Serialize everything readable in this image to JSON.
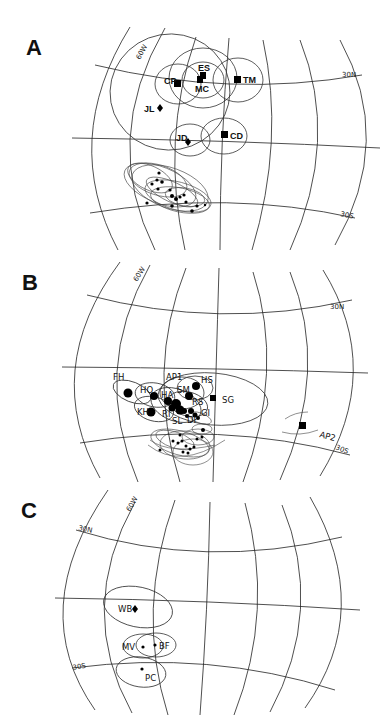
{
  "figure": {
    "panels": [
      {
        "id": "A",
        "label": "A",
        "grid_labels": {
          "meridian": "60W",
          "north_parallel": "30N",
          "south_parallel": "30S"
        },
        "sites": [
          {
            "code": "CP",
            "symbol": "square"
          },
          {
            "code": "ES",
            "symbol": "square"
          },
          {
            "code": "MC",
            "symbol": "square"
          },
          {
            "code": "TM",
            "symbol": "square"
          },
          {
            "code": "JL",
            "symbol": "diamond"
          },
          {
            "code": "JD",
            "symbol": "diamond"
          },
          {
            "code": "CD",
            "symbol": "square"
          }
        ],
        "cluster": {
          "description": "unlabeled cluster of small dots with overlapping confidence ellipses near 30S"
        }
      },
      {
        "id": "B",
        "label": "B",
        "grid_labels": {
          "meridian": "60W",
          "north_parallel": "30N",
          "south_parallel": "30S"
        },
        "sites": [
          {
            "code": "FH",
            "symbol": "circle"
          },
          {
            "code": "HO",
            "symbol": "circle"
          },
          {
            "code": "KH",
            "symbol": "circle"
          },
          {
            "code": "AP1",
            "symbol": "circle"
          },
          {
            "code": "HS",
            "symbol": "circle"
          },
          {
            "code": "SM",
            "symbol": "circle"
          },
          {
            "code": "RS",
            "symbol": "circle"
          },
          {
            "code": "HA",
            "symbol": "circle"
          },
          {
            "code": "SL",
            "symbol": "circle"
          },
          {
            "code": "SG",
            "symbol": "square"
          },
          {
            "code": "AP2",
            "symbol": "square"
          }
        ],
        "extra_labels": [
          "WI",
          "RI",
          "DI",
          "GI"
        ],
        "cluster": {
          "description": "unlabeled cluster of small dots with overlapping confidence ellipses near 30S"
        }
      },
      {
        "id": "C",
        "label": "C",
        "grid_labels": {
          "meridian": "60W",
          "north_parallel": "30N",
          "south_parallel": "30S"
        },
        "sites": [
          {
            "code": "WB",
            "symbol": "diamond"
          },
          {
            "code": "MV",
            "symbol": "dot"
          },
          {
            "code": "BF",
            "symbol": "dot"
          },
          {
            "code": "PC",
            "symbol": "dot"
          }
        ]
      }
    ]
  }
}
